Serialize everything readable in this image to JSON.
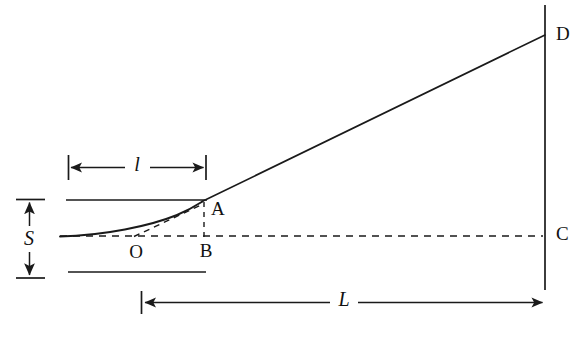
{
  "figure": {
    "kind": "geometric-optics-deflection-diagram",
    "background_color": "#ffffff",
    "ink_color": "#1a1a1a",
    "width": 583,
    "height": 356
  },
  "labels": {
    "point_a": "A",
    "point_b": "B",
    "point_c": "C",
    "point_d": "D",
    "point_o": "O",
    "dim_small_l": "l",
    "dim_large_l": "L",
    "dim_s": "S"
  },
  "geometry": {
    "screen_line": {
      "x": 545,
      "y_top": 5,
      "y_bottom": 290
    },
    "ray_segment": {
      "x1": 203,
      "y1": 201,
      "x2": 545,
      "y2": 35
    },
    "curve": {
      "start_x": 60,
      "start_y": 236,
      "end_x": 203,
      "end_y": 201
    },
    "upper_solid_line": {
      "x1": 66,
      "x2": 206,
      "y": 200
    },
    "lower_solid_line": {
      "x1": 68,
      "x2": 206,
      "y": 272
    },
    "optical_axis_dashed": {
      "x1": 60,
      "x2": 545,
      "y": 236
    },
    "vertical_dashed_ab": {
      "x": 204,
      "y1": 203,
      "y2": 237
    },
    "tangent_dashed_oa": {
      "x1": 133,
      "y1": 237,
      "x2": 202,
      "y2": 205
    },
    "dim_l_small": {
      "x1": 68,
      "x2": 206,
      "y": 167
    },
    "dim_l_large": {
      "x1": 141,
      "x2": 545,
      "y": 302
    },
    "dim_s": {
      "x": 30,
      "y1": 199,
      "y2": 278
    }
  },
  "label_positions": {
    "point_a": {
      "x": 211,
      "y": 211
    },
    "point_b": {
      "x": 206,
      "y": 253
    },
    "point_c": {
      "x": 557,
      "y": 236
    },
    "point_d": {
      "x": 557,
      "y": 36
    },
    "point_o": {
      "x": 136,
      "y": 254
    },
    "dim_small_l": {
      "x": 137,
      "y": 166
    },
    "dim_large_l": {
      "x": 344,
      "y": 301
    },
    "dim_s": {
      "x": 29,
      "y": 240
    }
  }
}
